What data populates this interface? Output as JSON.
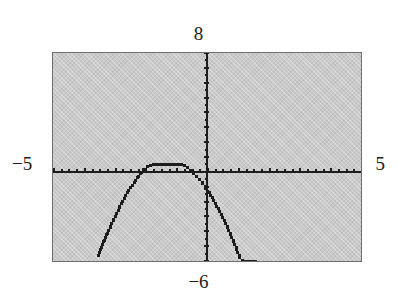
{
  "figure": {
    "kind": "graphing-calculator-screen",
    "background_color": "#ffffff",
    "screen_color": "#c9c9c9",
    "plot_color": "#1c1c1c",
    "border_color": "#6e6e6e"
  },
  "labels": {
    "ymax": "8",
    "ymin": "−6",
    "xmin": "−5",
    "xmax": "5"
  },
  "chart_data": {
    "type": "scatter",
    "title": "",
    "subtitle": "",
    "xlabel": "",
    "ylabel": "",
    "xlim": [
      -5,
      5
    ],
    "ylim": [
      -6,
      8
    ],
    "grid": false,
    "legend": null,
    "axes": {
      "x_axis_drawn": true,
      "y_axis_drawn": true,
      "x_axis_y_value": 0,
      "y_axis_x_value": 0,
      "x_tick_spacing": 0.25,
      "y_tick_spacing": 0.5,
      "tick_style": "dotted-pixel-marks"
    },
    "annotations": [
      {
        "text": "8",
        "role": "window-ymax",
        "position": "above-screen-center"
      },
      {
        "text": "−6",
        "role": "window-ymin",
        "position": "below-screen-center"
      },
      {
        "text": "−5",
        "role": "window-xmin",
        "position": "left-of-screen"
      },
      {
        "text": "5",
        "role": "window-xmax",
        "position": "right-of-screen"
      }
    ],
    "series": [
      {
        "name": "curve",
        "style": "dotted",
        "vertex": [
          -1.2,
          0.55
        ],
        "x": [
          -3.55,
          -3.45,
          -3.35,
          -3.25,
          -3.15,
          -3.05,
          -2.95,
          -2.85,
          -2.75,
          -2.65,
          -2.55,
          -2.45,
          -2.35,
          -2.25,
          -2.15,
          -2.05,
          -1.95,
          -1.85,
          -1.75,
          -1.65,
          -1.55,
          -1.45,
          -1.35,
          -1.25,
          -1.15,
          -1.05,
          -0.95,
          -0.85,
          -0.75,
          -0.65,
          -0.55,
          -0.45,
          -0.35,
          -0.25,
          -0.15,
          -0.05,
          0.05,
          0.15,
          0.25,
          0.35,
          0.45,
          0.55,
          0.65,
          0.75,
          0.85,
          0.95,
          1.05,
          1.15,
          1.25,
          1.35,
          1.45,
          1.55
        ],
        "y": [
          -5.62,
          -5.09,
          -4.58,
          -4.09,
          -3.62,
          -3.17,
          -2.74,
          -2.33,
          -1.94,
          -1.57,
          -1.22,
          -0.89,
          -0.58,
          -0.29,
          -0.03,
          0.21,
          0.39,
          0.49,
          0.54,
          0.55,
          0.55,
          0.54,
          0.53,
          0.55,
          0.55,
          0.55,
          0.54,
          0.52,
          0.43,
          0.3,
          0.14,
          -0.05,
          -0.27,
          -0.51,
          -0.78,
          -1.07,
          -1.38,
          -1.71,
          -2.07,
          -2.45,
          -2.85,
          -3.27,
          -3.71,
          -4.18,
          -4.66,
          -5.17,
          -5.7,
          -5.95,
          -5.98,
          -5.99,
          -6.0,
          -6.0
        ]
      }
    ]
  }
}
